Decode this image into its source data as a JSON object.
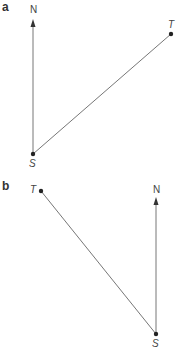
{
  "panels": [
    {
      "label": "a",
      "north_label": "N",
      "start_label": "S",
      "target_label": "T",
      "points": {
        "S": [
          33,
          154
        ],
        "N_tip": [
          33,
          22
        ],
        "T": [
          171,
          34
        ]
      }
    },
    {
      "label": "b",
      "north_label": "N",
      "start_label": "S",
      "target_label": "T",
      "points": {
        "S": [
          156,
          334
        ],
        "N_tip": [
          156,
          199
        ],
        "T": [
          41,
          191
        ]
      }
    }
  ],
  "colors": {
    "line": "#666666",
    "dot": "#222222",
    "text": "#333333"
  }
}
